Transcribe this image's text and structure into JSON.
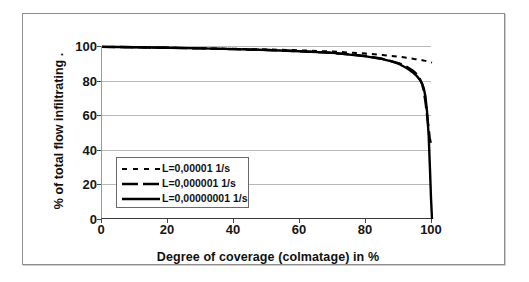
{
  "chart_data": {
    "type": "line",
    "title": "",
    "xlabel": "Degree of coverage  (colmatage) in %",
    "ylabel": "%  of total flow infiltrating  .",
    "xlim": [
      0,
      100
    ],
    "ylim": [
      0,
      100
    ],
    "xticks": [
      0,
      20,
      40,
      60,
      80,
      100
    ],
    "yticks": [
      0,
      20,
      40,
      60,
      80,
      100
    ],
    "grid": "horizontal",
    "legend_position": "inside-lower-left",
    "series": [
      {
        "name": "L=0,00001 1/s",
        "style": "dashed",
        "color": "#000000",
        "x": [
          0,
          5,
          10,
          20,
          30,
          40,
          50,
          60,
          70,
          80,
          85,
          90,
          93,
          95,
          96,
          97,
          98,
          99,
          99.5,
          100
        ],
        "values": [
          99.5,
          99.4,
          99.3,
          99.0,
          98.7,
          98.4,
          98.0,
          97.5,
          96.8,
          95.6,
          94.8,
          93.8,
          93.0,
          92.4,
          92.1,
          91.8,
          91.4,
          91.0,
          90.7,
          90.4
        ]
      },
      {
        "name": "L=0,000001 1/s",
        "style": "long-dash",
        "color": "#000000",
        "x": [
          0,
          5,
          10,
          20,
          30,
          40,
          50,
          60,
          70,
          80,
          85,
          90,
          92,
          94,
          95,
          96,
          97,
          97.5,
          98,
          98.5,
          99,
          99.3,
          99.6
        ],
        "values": [
          99.5,
          99.4,
          99.3,
          99.0,
          98.6,
          98.2,
          97.7,
          97.0,
          96.0,
          94.2,
          92.6,
          90.0,
          88.4,
          86.0,
          84.4,
          82.2,
          78.0,
          74.0,
          68.0,
          60.0,
          52.0,
          47.0,
          44.0
        ]
      },
      {
        "name": "L=0,00000001 1/s",
        "style": "solid",
        "color": "#000000",
        "x": [
          0,
          5,
          10,
          20,
          30,
          40,
          50,
          60,
          70,
          80,
          85,
          88,
          90,
          92,
          93,
          94,
          95,
          95.5,
          96,
          96.5,
          97,
          97.5,
          98,
          98.5,
          99,
          99.4,
          99.7,
          100
        ],
        "values": [
          99.5,
          99.4,
          99.3,
          99.0,
          98.6,
          98.2,
          97.7,
          97.0,
          96.0,
          94.0,
          92.4,
          91.0,
          89.6,
          87.6,
          86.4,
          85.0,
          83.4,
          82.4,
          81.2,
          80.0,
          78.2,
          75.6,
          71.0,
          62.0,
          48.0,
          28.0,
          12.0,
          0.0
        ]
      }
    ]
  },
  "axes": {
    "x_title": "Degree of coverage  (colmatage) in %",
    "y_title": "%  of total flow infiltrating  .",
    "x_ticks": [
      "0",
      "20",
      "40",
      "60",
      "80",
      "100"
    ],
    "y_ticks": [
      "0",
      "20",
      "40",
      "60",
      "80",
      "100"
    ]
  },
  "legend": {
    "items": [
      {
        "label": "L=0,00001 1/s",
        "style": "dashed"
      },
      {
        "label": "L=0,000001 1/s",
        "style": "long-dash"
      },
      {
        "label": "L=0,00000001 1/s",
        "style": "solid"
      }
    ]
  },
  "colors": {
    "line": "#000000",
    "grid": "#b9b9b9",
    "frame": "#8d8d8d",
    "text": "#101010",
    "background": "#ffffff"
  }
}
